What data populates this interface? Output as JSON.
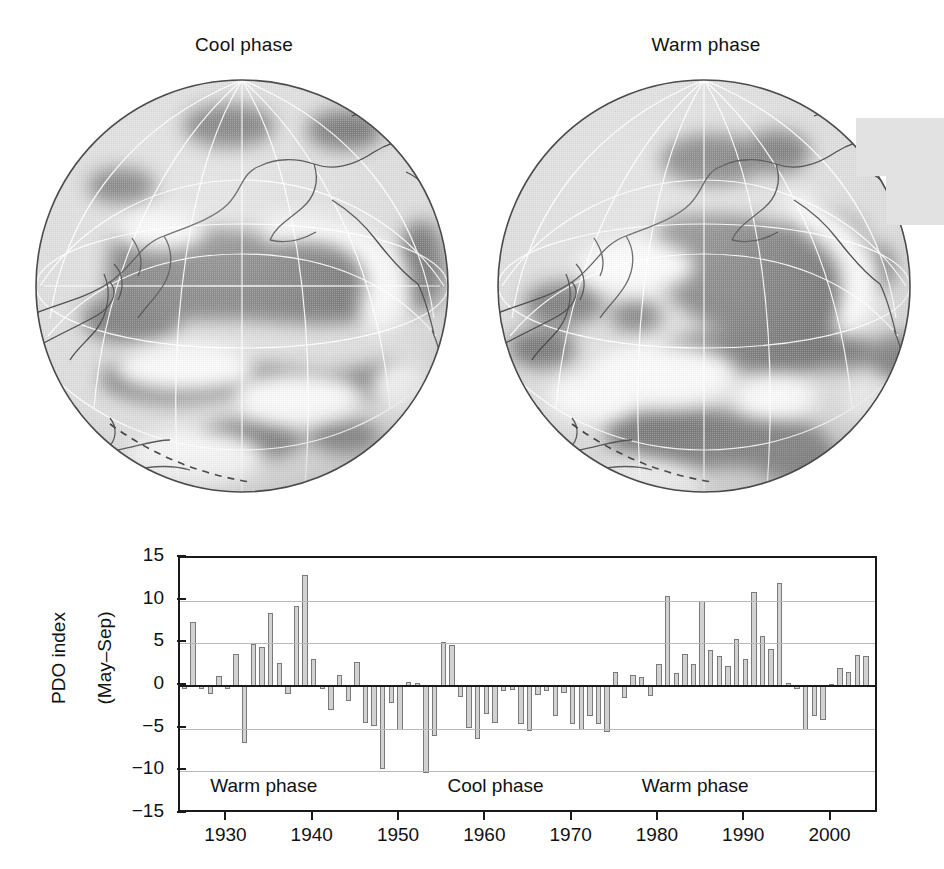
{
  "globes": [
    {
      "title": "Cool phase",
      "id": "globe-cool-phase"
    },
    {
      "title": "Warm phase",
      "id": "globe-warm-phase"
    }
  ],
  "chart_data": {
    "type": "bar",
    "title": "",
    "xlabel": "",
    "ylabel": "PDO index\n(May–Sep)",
    "ylabel_line1": "PDO index",
    "ylabel_line2": "(May–Sep)",
    "ylim": [
      -15,
      15
    ],
    "xlim": [
      1924.5,
      2005.5
    ],
    "grid": true,
    "gridlines": [
      10,
      5,
      -5,
      -10
    ],
    "zero_line": 0,
    "yticks": [
      15,
      10,
      5,
      0,
      -5,
      -10,
      -15
    ],
    "ytick_labels": [
      "15",
      "10",
      "5",
      "0",
      "−5",
      "−10",
      "−15"
    ],
    "xticks": [
      1930,
      1940,
      1950,
      1960,
      1970,
      1980,
      1990,
      2000
    ],
    "xtick_labels": [
      "1930",
      "1940",
      "1950",
      "1960",
      "1970",
      "1980",
      "1990",
      "2000"
    ],
    "bar_fill": "#d2d2d2",
    "bar_edge": "#7a7a7a",
    "annotations": [
      {
        "text": "Warm phase",
        "x": 1928.0,
        "y": -12.0
      },
      {
        "text": "Cool phase",
        "x": 1955.5,
        "y": -12.0
      },
      {
        "text": "Warm phase",
        "x": 1978.0,
        "y": -12.0
      }
    ],
    "categories": [
      1925,
      1926,
      1927,
      1928,
      1929,
      1930,
      1931,
      1932,
      1933,
      1934,
      1935,
      1936,
      1937,
      1938,
      1939,
      1940,
      1941,
      1942,
      1943,
      1944,
      1945,
      1946,
      1947,
      1948,
      1949,
      1950,
      1951,
      1952,
      1953,
      1954,
      1955,
      1956,
      1957,
      1958,
      1959,
      1960,
      1961,
      1962,
      1963,
      1964,
      1965,
      1966,
      1967,
      1968,
      1969,
      1970,
      1971,
      1972,
      1973,
      1974,
      1975,
      1976,
      1977,
      1978,
      1979,
      1980,
      1981,
      1982,
      1983,
      1984,
      1985,
      1986,
      1987,
      1988,
      1989,
      1990,
      1991,
      1992,
      1993,
      1994,
      1995,
      1996,
      1997,
      1998,
      1999,
      2000,
      2001,
      2002,
      2003,
      2004
    ],
    "values": [
      -0.4,
      7.5,
      -0.3,
      -0.9,
      1.2,
      -0.4,
      3.8,
      -6.7,
      4.9,
      4.6,
      8.6,
      2.7,
      -0.9,
      9.4,
      13.0,
      3.2,
      -0.3,
      -2.8,
      1.3,
      -1.8,
      2.8,
      -4.3,
      -4.7,
      -9.7,
      -2.0,
      -5.2,
      0.5,
      0.3,
      -10.2,
      -5.9,
      5.1,
      4.8,
      -1.3,
      -4.9,
      -6.2,
      -3.3,
      -4.3,
      -0.6,
      -0.5,
      -4.4,
      -5.3,
      -1.1,
      -0.6,
      -3.5,
      -0.8,
      -4.4,
      -5.2,
      -3.5,
      -4.4,
      -5.4,
      1.6,
      -1.4,
      1.3,
      1.1,
      -1.2,
      2.6,
      10.5,
      1.5,
      3.7,
      2.6,
      10.0,
      4.2,
      3.5,
      2.4,
      5.5,
      3.2,
      11.0,
      5.9,
      4.3,
      12.1,
      0.3,
      -0.4,
      -5.1,
      -3.5,
      -4.0,
      0.2,
      2.1,
      1.6,
      3.6,
      3.5
    ]
  }
}
